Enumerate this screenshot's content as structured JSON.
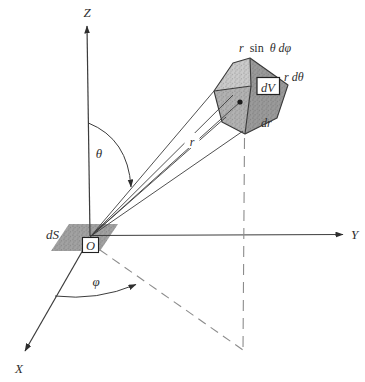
{
  "figure": {
    "axes": {
      "z_label": "Z",
      "y_label": "Y",
      "x_label": "X"
    },
    "angles": {
      "polar": "θ",
      "azimuthal": "φ"
    },
    "labels": {
      "radius": "r",
      "surface_element": "dS",
      "origin": "O",
      "volume_element": "dV",
      "edge_azimuthal_r": "r",
      "edge_azimuthal_sin": "sin",
      "edge_azimuthal_rest": "θ dφ",
      "edge_polar": "r dθ",
      "edge_radial": "dr"
    },
    "colors": {
      "ink": "#2e2e2e",
      "line": "#3c3c3c",
      "face_top": "#cbcbcb",
      "face_front": "#b2b2b2",
      "face_right": "#9a9a9a",
      "surface_fill": "#a2a2a2",
      "dash": "#8c8c8c"
    }
  }
}
